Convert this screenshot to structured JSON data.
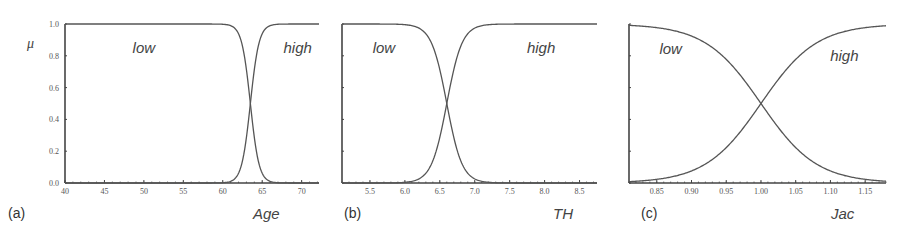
{
  "figure": {
    "y_symbol": "μ",
    "line_color": "#555555",
    "axis_color": "#444444",
    "background": "#ffffff"
  },
  "chart_data": [
    {
      "type": "line",
      "panel_label": "(a)",
      "title": "",
      "xlabel": "Age",
      "ylabel": "μ",
      "xlim": [
        40,
        72.2
      ],
      "ylim": [
        0,
        1
      ],
      "xticks": [
        40,
        45,
        50,
        55,
        60,
        65,
        70
      ],
      "xtick_labels": [
        "40",
        "45",
        "50",
        "55",
        "60",
        "65",
        "70"
      ],
      "yticks": [
        0.0,
        0.2,
        0.4,
        0.6,
        0.8,
        1.0
      ],
      "ytick_labels": [
        "0.0",
        "0.2",
        "0.4",
        "0.6",
        "0.8",
        "1.0"
      ],
      "show_ytick_labels": true,
      "grid": false,
      "series": [
        {
          "name": "low",
          "shape": "decreasing-sigmoid",
          "center": 63.5,
          "width": 0.55,
          "x": [
            40,
            55,
            60,
            61,
            62,
            63,
            63.5,
            64,
            65,
            66,
            67,
            72.2
          ],
          "y": [
            1.0,
            1.0,
            1.0,
            0.99,
            0.94,
            0.71,
            0.5,
            0.29,
            0.06,
            0.01,
            0.0,
            0.0
          ]
        },
        {
          "name": "high",
          "shape": "increasing-sigmoid",
          "center": 63.5,
          "width": 0.55,
          "x": [
            40,
            55,
            60,
            61,
            62,
            63,
            63.5,
            64,
            65,
            66,
            67,
            72.2
          ],
          "y": [
            0.0,
            0.0,
            0.0,
            0.01,
            0.06,
            0.29,
            0.5,
            0.71,
            0.94,
            0.99,
            1.0,
            1.0
          ]
        }
      ],
      "annotations": [
        {
          "text": "low",
          "x": 50,
          "y": 0.85
        },
        {
          "text": "high",
          "x": 69.5,
          "y": 0.85
        }
      ]
    },
    {
      "type": "line",
      "panel_label": "(b)",
      "title": "",
      "xlabel": "TH",
      "ylabel": "",
      "xlim": [
        5.1,
        8.75
      ],
      "ylim": [
        0,
        1
      ],
      "xticks": [
        5.5,
        6.0,
        6.5,
        7.0,
        7.5,
        8.0,
        8.5
      ],
      "xtick_labels": [
        "5.5",
        "6.0",
        "6.5",
        "7.0",
        "7.5",
        "8.0",
        "8.5"
      ],
      "yticks": [
        0.0,
        0.2,
        0.4,
        0.6,
        0.8,
        1.0
      ],
      "show_ytick_labels": false,
      "grid": false,
      "series": [
        {
          "name": "low",
          "shape": "decreasing-sigmoid",
          "center": 6.6,
          "width": 0.11,
          "x": [
            5.1,
            6.0,
            6.2,
            6.4,
            6.5,
            6.6,
            6.7,
            6.8,
            7.0,
            7.2,
            8.75
          ],
          "y": [
            1.0,
            1.0,
            0.98,
            0.86,
            0.71,
            0.5,
            0.29,
            0.14,
            0.03,
            0.0,
            0.0
          ]
        },
        {
          "name": "high",
          "shape": "increasing-sigmoid",
          "center": 6.6,
          "width": 0.11,
          "x": [
            5.1,
            6.0,
            6.2,
            6.4,
            6.5,
            6.6,
            6.7,
            6.8,
            7.0,
            7.2,
            8.75
          ],
          "y": [
            0.0,
            0.0,
            0.02,
            0.14,
            0.29,
            0.5,
            0.71,
            0.86,
            0.97,
            1.0,
            1.0
          ]
        }
      ],
      "annotations": [
        {
          "text": "low",
          "x": 5.7,
          "y": 0.85
        },
        {
          "text": "high",
          "x": 7.95,
          "y": 0.85
        }
      ]
    },
    {
      "type": "line",
      "panel_label": "(c)",
      "title": "",
      "xlabel": "Jac",
      "ylabel": "",
      "xlim": [
        0.81,
        1.18
      ],
      "ylim": [
        0,
        1
      ],
      "xticks": [
        0.85,
        0.9,
        0.95,
        1.0,
        1.05,
        1.1,
        1.15
      ],
      "xtick_labels": [
        "0.85",
        "0.90",
        "0.95",
        "1.00",
        "1.05",
        "1.10",
        "1.15"
      ],
      "yticks": [
        0.0,
        0.2,
        0.4,
        0.6,
        0.8,
        1.0
      ],
      "show_ytick_labels": false,
      "grid": false,
      "series": [
        {
          "name": "low",
          "shape": "decreasing-sigmoid",
          "center": 1.0,
          "width": 0.04,
          "x": [
            0.81,
            0.85,
            0.9,
            0.95,
            1.0,
            1.05,
            1.1,
            1.15,
            1.18
          ],
          "y": [
            0.99,
            0.98,
            0.92,
            0.78,
            0.5,
            0.22,
            0.08,
            0.02,
            0.01
          ]
        },
        {
          "name": "high",
          "shape": "increasing-sigmoid",
          "center": 1.0,
          "width": 0.04,
          "x": [
            0.81,
            0.85,
            0.9,
            0.95,
            1.0,
            1.05,
            1.1,
            1.15,
            1.18
          ],
          "y": [
            0.01,
            0.02,
            0.08,
            0.22,
            0.5,
            0.78,
            0.92,
            0.98,
            0.99
          ]
        }
      ],
      "annotations": [
        {
          "text": "low",
          "x": 0.87,
          "y": 0.84
        },
        {
          "text": "high",
          "x": 1.12,
          "y": 0.8
        }
      ]
    }
  ],
  "layout": {
    "panels": [
      {
        "left": 65,
        "right": 319,
        "top": 24,
        "bottom": 183,
        "label_x": 8,
        "label_y": 218,
        "xlabel_x": 253,
        "xlabel_y": 219,
        "ylabel_x": 27,
        "ylabel_y": 48
      },
      {
        "left": 342,
        "right": 597,
        "top": 24,
        "bottom": 183,
        "label_x": 344,
        "label_y": 218,
        "xlabel_x": 553,
        "xlabel_y": 219
      },
      {
        "left": 629,
        "right": 886,
        "top": 24,
        "bottom": 183,
        "label_x": 641,
        "label_y": 218,
        "xlabel_x": 831,
        "xlabel_y": 219
      }
    ]
  }
}
